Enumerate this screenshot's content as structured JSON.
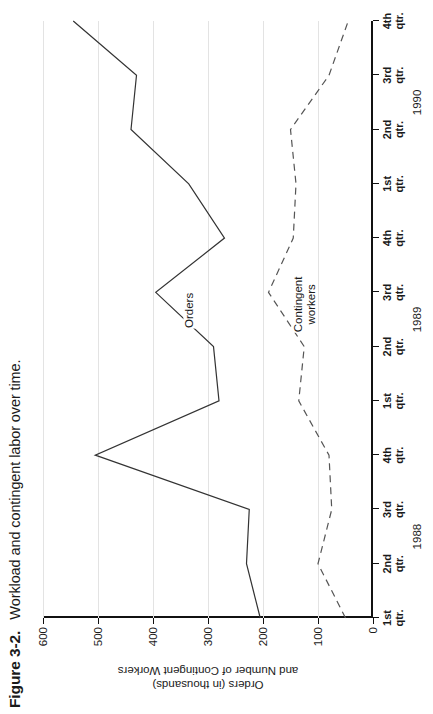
{
  "figure": {
    "number": "Figure 3-2.",
    "caption": "Workload and contingent labor over time."
  },
  "chart_data": {
    "type": "line",
    "title": "Workload and contingent labor over time.",
    "xlabel": "",
    "ylabel": "Orders (in thousands) and Number of Contingent Workers",
    "ylabel_line1": "Orders (in thousands)",
    "ylabel_line2": "and Number of Contingent Workers",
    "ylim": [
      0,
      600
    ],
    "yticks": [
      0,
      100,
      200,
      300,
      400,
      500,
      600
    ],
    "ytick_labels": [
      "0",
      "100",
      "200",
      "300",
      "400",
      "500",
      "600"
    ],
    "grid": true,
    "grid_axis": "y",
    "legend": "inline-labels",
    "categories": [
      "1st qtr.",
      "2nd qtr.",
      "3rd qtr.",
      "4th qtr.",
      "1st qtr.",
      "2nd qtr.",
      "3rd qtr.",
      "4th qtr.",
      "1st qtr.",
      "2nd qtr.",
      "3rd qtr.",
      "4th qtr."
    ],
    "year_groups": [
      {
        "label": "1988",
        "start_index": 0,
        "end_index": 3
      },
      {
        "label": "1989",
        "start_index": 4,
        "end_index": 7
      },
      {
        "label": "1990",
        "start_index": 8,
        "end_index": 11
      }
    ],
    "series": [
      {
        "name": "Orders",
        "style": "solid",
        "color": "#333333",
        "values": [
          205,
          230,
          225,
          505,
          280,
          290,
          395,
          270,
          335,
          440,
          430,
          545
        ]
      },
      {
        "name": "Contingent workers",
        "style": "dashed",
        "color": "#555555",
        "label_line1": "Contingent",
        "label_line2": "workers",
        "values": [
          50,
          100,
          75,
          80,
          135,
          125,
          190,
          145,
          140,
          150,
          80,
          45
        ]
      }
    ],
    "annotations": [
      {
        "text": "Orders",
        "series": "Orders",
        "near_index": 6
      },
      {
        "text": "Contingent workers",
        "series": "Contingent workers",
        "near_index": 6
      }
    ]
  }
}
